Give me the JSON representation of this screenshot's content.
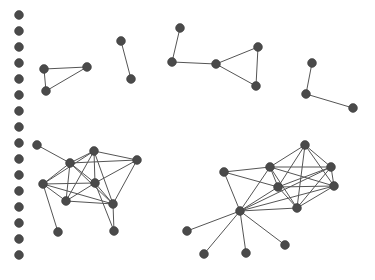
{
  "figure": {
    "kind": "network-graph",
    "title": "",
    "background_color": "#ffffff",
    "node_color": "#4a4a4a",
    "node_stroke_color": "#3a3a3a",
    "edge_color": "#555555",
    "node_radius": 4.4,
    "edge_width": 1,
    "width": 375,
    "height": 280
  },
  "chart_data": {
    "type": "scatter",
    "title": "",
    "xlabel": "",
    "ylabel": "",
    "grid": false,
    "legend": null,
    "xlim": [
      0,
      375
    ],
    "ylim": [
      0,
      280
    ],
    "summary": {
      "total_nodes": 48,
      "total_edges": 68,
      "component_count": 22,
      "isolated_node_count": 16
    },
    "components": [
      {
        "name": "isolated-column",
        "node_count": 16,
        "edge_count": 0,
        "description": "vertical column of singleton nodes along the left margin"
      },
      {
        "name": "triangle-upper-left",
        "node_count": 3,
        "edge_count": 3,
        "description": "closed triangle"
      },
      {
        "name": "dyad-upper-left",
        "node_count": 2,
        "edge_count": 1,
        "description": "two nodes joined by a single edge"
      },
      {
        "name": "cluster-upper-middle",
        "node_count": 5,
        "edge_count": 5,
        "description": "path into a triangle"
      },
      {
        "name": "path-upper-right",
        "node_count": 3,
        "edge_count": 2,
        "description": "three-node open path"
      },
      {
        "name": "cluster-lower-left",
        "node_count": 9,
        "edge_count": 23,
        "description": "dense cluster with two pendant nodes"
      },
      {
        "name": "cluster-lower-right",
        "node_count": 11,
        "edge_count": 28,
        "description": "dense core plus a hub with four pendant nodes"
      }
    ],
    "nodes": [
      {
        "id": "i1",
        "x": 19,
        "y": 15,
        "component": "isolated-column"
      },
      {
        "id": "i2",
        "x": 19,
        "y": 31,
        "component": "isolated-column"
      },
      {
        "id": "i3",
        "x": 19,
        "y": 47,
        "component": "isolated-column"
      },
      {
        "id": "i4",
        "x": 19,
        "y": 63,
        "component": "isolated-column"
      },
      {
        "id": "i5",
        "x": 19,
        "y": 79,
        "component": "isolated-column"
      },
      {
        "id": "i6",
        "x": 19,
        "y": 95,
        "component": "isolated-column"
      },
      {
        "id": "i7",
        "x": 19,
        "y": 111,
        "component": "isolated-column"
      },
      {
        "id": "i8",
        "x": 19,
        "y": 127,
        "component": "isolated-column"
      },
      {
        "id": "i9",
        "x": 19,
        "y": 143,
        "component": "isolated-column"
      },
      {
        "id": "i10",
        "x": 19,
        "y": 159,
        "component": "isolated-column"
      },
      {
        "id": "i11",
        "x": 19,
        "y": 175,
        "component": "isolated-column"
      },
      {
        "id": "i12",
        "x": 19,
        "y": 191,
        "component": "isolated-column"
      },
      {
        "id": "i13",
        "x": 19,
        "y": 207,
        "component": "isolated-column"
      },
      {
        "id": "i14",
        "x": 19,
        "y": 223,
        "component": "isolated-column"
      },
      {
        "id": "i15",
        "x": 19,
        "y": 239,
        "component": "isolated-column"
      },
      {
        "id": "i16",
        "x": 19,
        "y": 255,
        "component": "isolated-column"
      },
      {
        "id": "t1",
        "x": 44,
        "y": 69,
        "component": "triangle-upper-left"
      },
      {
        "id": "t2",
        "x": 87,
        "y": 67,
        "component": "triangle-upper-left"
      },
      {
        "id": "t3",
        "x": 46,
        "y": 91,
        "component": "triangle-upper-left"
      },
      {
        "id": "d1",
        "x": 121,
        "y": 41,
        "component": "dyad-upper-left"
      },
      {
        "id": "d2",
        "x": 131,
        "y": 79,
        "component": "dyad-upper-left"
      },
      {
        "id": "m1",
        "x": 180,
        "y": 28,
        "component": "cluster-upper-middle"
      },
      {
        "id": "m2",
        "x": 172,
        "y": 62,
        "component": "cluster-upper-middle"
      },
      {
        "id": "m3",
        "x": 216,
        "y": 64,
        "component": "cluster-upper-middle"
      },
      {
        "id": "m4",
        "x": 258,
        "y": 47,
        "component": "cluster-upper-middle"
      },
      {
        "id": "m5",
        "x": 256,
        "y": 86,
        "component": "cluster-upper-middle"
      },
      {
        "id": "p1",
        "x": 312,
        "y": 63,
        "component": "path-upper-right"
      },
      {
        "id": "p2",
        "x": 306,
        "y": 94,
        "component": "path-upper-right"
      },
      {
        "id": "p3",
        "x": 353,
        "y": 108,
        "component": "path-upper-right"
      },
      {
        "id": "L1",
        "x": 37,
        "y": 145,
        "component": "cluster-lower-left"
      },
      {
        "id": "L2",
        "x": 70,
        "y": 163,
        "component": "cluster-lower-left"
      },
      {
        "id": "L3",
        "x": 94,
        "y": 151,
        "component": "cluster-lower-left"
      },
      {
        "id": "L4",
        "x": 137,
        "y": 160,
        "component": "cluster-lower-left"
      },
      {
        "id": "L5",
        "x": 43,
        "y": 184,
        "component": "cluster-lower-left"
      },
      {
        "id": "L6",
        "x": 95,
        "y": 183,
        "component": "cluster-lower-left"
      },
      {
        "id": "L7",
        "x": 113,
        "y": 204,
        "component": "cluster-lower-left"
      },
      {
        "id": "L8",
        "x": 66,
        "y": 201,
        "component": "cluster-lower-left"
      },
      {
        "id": "L9",
        "x": 58,
        "y": 232,
        "component": "cluster-lower-left"
      },
      {
        "id": "L10",
        "x": 114,
        "y": 231,
        "component": "cluster-lower-left"
      },
      {
        "id": "R1",
        "x": 305,
        "y": 145,
        "component": "cluster-lower-right"
      },
      {
        "id": "R2",
        "x": 270,
        "y": 167,
        "component": "cluster-lower-right"
      },
      {
        "id": "R3",
        "x": 278,
        "y": 187,
        "component": "cluster-lower-right"
      },
      {
        "id": "R4",
        "x": 331,
        "y": 167,
        "component": "cluster-lower-right"
      },
      {
        "id": "R5",
        "x": 334,
        "y": 186,
        "component": "cluster-lower-right"
      },
      {
        "id": "R6",
        "x": 297,
        "y": 208,
        "component": "cluster-lower-right"
      },
      {
        "id": "R7",
        "x": 224,
        "y": 172,
        "component": "cluster-lower-right"
      },
      {
        "id": "R8",
        "x": 240,
        "y": 211,
        "component": "cluster-lower-right"
      },
      {
        "id": "R9",
        "x": 187,
        "y": 231,
        "component": "cluster-lower-right"
      },
      {
        "id": "R10",
        "x": 204,
        "y": 254,
        "component": "cluster-lower-right"
      },
      {
        "id": "R11",
        "x": 246,
        "y": 253,
        "component": "cluster-lower-right"
      },
      {
        "id": "R12",
        "x": 285,
        "y": 245,
        "component": "cluster-lower-right"
      }
    ],
    "edges": [
      {
        "source": "t1",
        "target": "t2"
      },
      {
        "source": "t1",
        "target": "t3"
      },
      {
        "source": "t3",
        "target": "t2"
      },
      {
        "source": "d1",
        "target": "d2"
      },
      {
        "source": "m1",
        "target": "m2"
      },
      {
        "source": "m2",
        "target": "m3"
      },
      {
        "source": "m3",
        "target": "m4"
      },
      {
        "source": "m3",
        "target": "m5"
      },
      {
        "source": "m4",
        "target": "m5"
      },
      {
        "source": "p1",
        "target": "p2"
      },
      {
        "source": "p2",
        "target": "p3"
      },
      {
        "source": "L1",
        "target": "L2"
      },
      {
        "source": "L2",
        "target": "L3"
      },
      {
        "source": "L2",
        "target": "L4"
      },
      {
        "source": "L2",
        "target": "L5"
      },
      {
        "source": "L2",
        "target": "L6"
      },
      {
        "source": "L2",
        "target": "L7"
      },
      {
        "source": "L2",
        "target": "L8"
      },
      {
        "source": "L3",
        "target": "L4"
      },
      {
        "source": "L3",
        "target": "L6"
      },
      {
        "source": "L3",
        "target": "L7"
      },
      {
        "source": "L3",
        "target": "L8"
      },
      {
        "source": "L3",
        "target": "L5"
      },
      {
        "source": "L4",
        "target": "L6"
      },
      {
        "source": "L4",
        "target": "L7"
      },
      {
        "source": "L5",
        "target": "L6"
      },
      {
        "source": "L5",
        "target": "L7"
      },
      {
        "source": "L5",
        "target": "L8"
      },
      {
        "source": "L5",
        "target": "L9"
      },
      {
        "source": "L6",
        "target": "L7"
      },
      {
        "source": "L6",
        "target": "L8"
      },
      {
        "source": "L7",
        "target": "L8"
      },
      {
        "source": "L7",
        "target": "L10"
      },
      {
        "source": "L6",
        "target": "L10"
      },
      {
        "source": "R1",
        "target": "R2"
      },
      {
        "source": "R1",
        "target": "R3"
      },
      {
        "source": "R1",
        "target": "R4"
      },
      {
        "source": "R1",
        "target": "R5"
      },
      {
        "source": "R1",
        "target": "R6"
      },
      {
        "source": "R2",
        "target": "R3"
      },
      {
        "source": "R2",
        "target": "R4"
      },
      {
        "source": "R2",
        "target": "R5"
      },
      {
        "source": "R2",
        "target": "R6"
      },
      {
        "source": "R2",
        "target": "R7"
      },
      {
        "source": "R2",
        "target": "R8"
      },
      {
        "source": "R3",
        "target": "R4"
      },
      {
        "source": "R3",
        "target": "R5"
      },
      {
        "source": "R3",
        "target": "R6"
      },
      {
        "source": "R3",
        "target": "R7"
      },
      {
        "source": "R3",
        "target": "R8"
      },
      {
        "source": "R4",
        "target": "R5"
      },
      {
        "source": "R4",
        "target": "R6"
      },
      {
        "source": "R5",
        "target": "R6"
      },
      {
        "source": "R6",
        "target": "R8"
      },
      {
        "source": "R7",
        "target": "R8"
      },
      {
        "source": "R8",
        "target": "R9"
      },
      {
        "source": "R8",
        "target": "R10"
      },
      {
        "source": "R8",
        "target": "R11"
      },
      {
        "source": "R8",
        "target": "R12"
      },
      {
        "source": "R8",
        "target": "R4"
      },
      {
        "source": "R8",
        "target": "R5"
      }
    ]
  }
}
